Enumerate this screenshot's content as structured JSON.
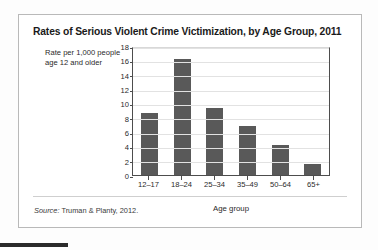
{
  "card": {
    "title": "Rates of Serious Violent Crime Victimization, by Age Group, 2011",
    "source_prefix": "Source:",
    "source_text": " Truman & Planty, 2012."
  },
  "chart_data": {
    "type": "bar",
    "title": "Rates of Serious Violent Crime Victimization, by Age Group, 2011",
    "xlabel": "Age group",
    "ylabel": "Rate per 1,000 people age 12 and older",
    "categories": [
      "12–17",
      "18–24",
      "25–34",
      "35–49",
      "50–64",
      "65+"
    ],
    "values": [
      8.7,
      16.2,
      9.4,
      6.9,
      4.2,
      1.6
    ],
    "ylim": [
      0,
      18
    ],
    "yticks": [
      0,
      2,
      4,
      6,
      8,
      10,
      12,
      14,
      16,
      18
    ],
    "ytick_labels": [
      "0",
      "2",
      "4",
      "6",
      "8",
      "10",
      "12",
      "14",
      "16",
      "18"
    ],
    "grid": true,
    "legend": "none",
    "bar_color": "#595959",
    "axis_color": "#4d4d4d",
    "grid_color": "#e2e2e2"
  }
}
